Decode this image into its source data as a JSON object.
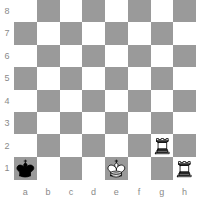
{
  "diagram": {
    "type": "chess-board-diagram",
    "orientation": "white",
    "colors": {
      "light_square": "#ffffff",
      "dark_square": "#9a9a9a",
      "label": "#8a8a8a",
      "white_piece_fill": "#ffffff",
      "white_piece_stroke": "#000000",
      "black_piece_fill": "#000000",
      "black_piece_stroke": "#000000"
    },
    "rank_labels": [
      "8",
      "7",
      "6",
      "5",
      "4",
      "3",
      "2",
      "1"
    ],
    "file_labels": [
      "a",
      "b",
      "c",
      "d",
      "e",
      "f",
      "g",
      "h"
    ],
    "pieces": [
      {
        "square": "a1",
        "piece": "black-king",
        "symbol": "♚",
        "color": "black",
        "type": "king"
      },
      {
        "square": "e1",
        "piece": "white-king",
        "symbol": "♔",
        "color": "white",
        "type": "king"
      },
      {
        "square": "g2",
        "piece": "white-rook",
        "symbol": "♖",
        "color": "white",
        "type": "rook"
      },
      {
        "square": "h1",
        "piece": "white-rook",
        "symbol": "♖",
        "color": "white",
        "type": "rook"
      }
    ],
    "fen": "8/8/8/8/8/8/6R1/k3K2R",
    "square_names": [
      [
        "a8",
        "b8",
        "c8",
        "d8",
        "e8",
        "f8",
        "g8",
        "h8"
      ],
      [
        "a7",
        "b7",
        "c7",
        "d7",
        "e7",
        "f7",
        "g7",
        "h7"
      ],
      [
        "a6",
        "b6",
        "c6",
        "d6",
        "e6",
        "f6",
        "g6",
        "h6"
      ],
      [
        "a5",
        "b5",
        "c5",
        "d5",
        "e5",
        "f5",
        "g5",
        "h5"
      ],
      [
        "a4",
        "b4",
        "c4",
        "d4",
        "e4",
        "f4",
        "g4",
        "h4"
      ],
      [
        "a3",
        "b3",
        "c3",
        "d3",
        "e3",
        "f3",
        "g3",
        "h3"
      ],
      [
        "a2",
        "b2",
        "c2",
        "d2",
        "e2",
        "f2",
        "g2",
        "h2"
      ],
      [
        "a1",
        "b1",
        "c1",
        "d1",
        "e1",
        "f1",
        "g1",
        "h1"
      ]
    ]
  }
}
